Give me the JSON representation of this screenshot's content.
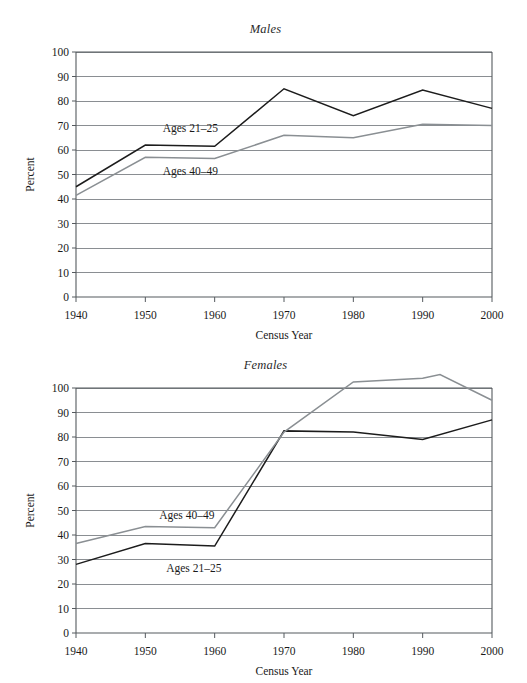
{
  "page": {
    "background": "#ffffff",
    "series_colors": {
      "ages_21_25": "#1c1c1c",
      "ages_40_49": "#8a8f93"
    },
    "grid_color": "#7d8286",
    "axis_color": "#555a5e"
  },
  "charts": [
    {
      "id": "males",
      "title": "Males",
      "xlabel": "Census Year",
      "ylabel": "Percent",
      "series_labels": {
        "upper": "Ages 21–25",
        "lower": "Ages 40–49"
      },
      "yticks": [
        "0",
        "10",
        "20",
        "30",
        "40",
        "50",
        "60",
        "70",
        "80",
        "90",
        "100"
      ],
      "xticks": [
        "1940",
        "1950",
        "1960",
        "1970",
        "1980",
        "1990",
        "2000"
      ]
    },
    {
      "id": "females",
      "title": "Females",
      "xlabel": "Census Year",
      "ylabel": "Percent",
      "series_labels": {
        "upper": "Ages 40–49",
        "lower": "Ages 21–25"
      },
      "yticks": [
        "0",
        "10",
        "20",
        "30",
        "40",
        "50",
        "60",
        "70",
        "80",
        "90",
        "100"
      ],
      "xticks": [
        "1940",
        "1950",
        "1960",
        "1970",
        "1980",
        "1990",
        "2000"
      ]
    }
  ],
  "chart_data": [
    {
      "type": "line",
      "title": "Males",
      "xlabel": "Census Year",
      "ylabel": "Percent",
      "x": [
        1940,
        1950,
        1960,
        1970,
        1980,
        1990,
        2000
      ],
      "xlim": [
        1940,
        2000
      ],
      "ylim": [
        0,
        100
      ],
      "yticks": [
        0,
        10,
        20,
        30,
        40,
        50,
        60,
        70,
        80,
        90,
        100
      ],
      "grid": true,
      "legend": "inline-labels",
      "series": [
        {
          "name": "Ages 21–25",
          "color": "#1c1c1c",
          "values": [
            45,
            62,
            61.5,
            85,
            74,
            84.5,
            77
          ]
        },
        {
          "name": "Ages 40–49",
          "color": "#8a8f93",
          "values": [
            41.5,
            57,
            56.5,
            66,
            65,
            70.5,
            70
          ]
        }
      ],
      "annotations": [
        {
          "text": "Ages 21–25",
          "x": 1952.5,
          "y": 67.5
        },
        {
          "text": "Ages 40–49",
          "x": 1952.5,
          "y": 50
        }
      ]
    },
    {
      "type": "line",
      "title": "Females",
      "xlabel": "Census Year",
      "ylabel": "Percent",
      "x": [
        1940,
        1950,
        1960,
        1970,
        1980,
        1990,
        2000
      ],
      "xlim": [
        1940,
        2000
      ],
      "ylim": [
        0,
        100
      ],
      "yticks": [
        0,
        10,
        20,
        30,
        40,
        50,
        60,
        70,
        80,
        90,
        100
      ],
      "grid": true,
      "legend": "inline-labels",
      "note": "Ages 40–49 series exceeds the 100 axis maximum between 1980 and 2000; it is drawn above the plot frame as in the original figure.",
      "series": [
        {
          "name": "Ages 21–25",
          "color": "#1c1c1c",
          "values": [
            28,
            36.5,
            35.5,
            82.5,
            82,
            79,
            87
          ]
        },
        {
          "name": "Ages 40–49",
          "color": "#8a8f93",
          "values": [
            36.5,
            43.5,
            43,
            82,
            102.5,
            104,
            95
          ],
          "extra_points": [
            {
              "x": 1992.5,
              "y": 105.5
            }
          ]
        }
      ],
      "annotations": [
        {
          "text": "Ages 40–49",
          "x": 1952,
          "y": 46.5
        },
        {
          "text": "Ages 21–25",
          "x": 1953,
          "y": 25
        }
      ]
    }
  ]
}
